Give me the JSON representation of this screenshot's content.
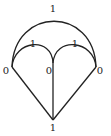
{
  "diagram": {
    "type": "graph",
    "stroke_color": "#222222",
    "vertices": [
      {
        "id": "left",
        "label": "0",
        "x": 12,
        "y": 67
      },
      {
        "id": "middle",
        "label": "0",
        "x": 53,
        "y": 63
      },
      {
        "id": "right",
        "label": "0",
        "x": 96,
        "y": 67
      },
      {
        "id": "bottom",
        "label": "1",
        "x": 53,
        "y": 120
      }
    ],
    "edges": [
      {
        "from": "left",
        "to": "right",
        "shape": "arc",
        "label": "1"
      },
      {
        "from": "left",
        "to": "middle",
        "shape": "arc",
        "label": "1"
      },
      {
        "from": "middle",
        "to": "right",
        "shape": "arc",
        "label": "1"
      },
      {
        "from": "left",
        "to": "bottom",
        "shape": "line",
        "label": ""
      },
      {
        "from": "middle",
        "to": "bottom",
        "shape": "line",
        "label": ""
      },
      {
        "from": "right",
        "to": "bottom",
        "shape": "line",
        "label": ""
      }
    ],
    "labels": {
      "top_arc": "1",
      "left_small_arc": "1",
      "right_small_arc": "1",
      "left_vertex": "0",
      "middle_vertex": "0",
      "right_vertex": "0",
      "bottom_vertex": "1"
    }
  }
}
